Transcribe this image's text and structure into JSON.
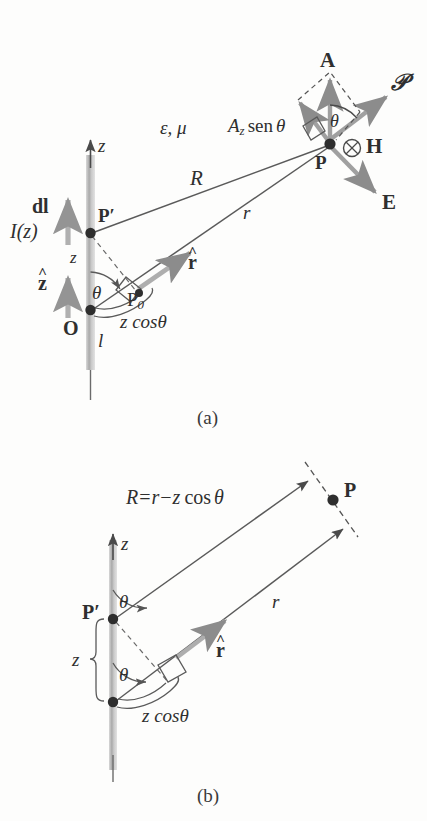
{
  "figure": {
    "background_color": "#fdfdfc",
    "ink_color": "#3a3a3a",
    "rod_color": "#b9b9b9",
    "vector_color": "#8f8f8f"
  },
  "panel_a": {
    "caption": "(a)",
    "medium_label": "ε, μ",
    "projection_label_A": "A",
    "projection_label_z": "z",
    "projection_label_sen": "sen",
    "projection_label_theta": "θ",
    "labels": {
      "z_axis": "z",
      "dl": "dl",
      "current": "I(z)",
      "z_hat": "z",
      "z_segment": "z",
      "origin": "O",
      "length": "l",
      "source_point": "P′",
      "foot_point": "P",
      "foot_point_sub": "0",
      "field_point": "P",
      "R_label": "R",
      "r_label": "r",
      "r_hat": "r",
      "theta": "θ",
      "theta_top": "θ",
      "z_cos_theta": "z cosθ",
      "vector_A": "A",
      "vector_P": "𝒫",
      "vector_H": "H",
      "vector_E": "E",
      "H_into_page": "⊗"
    }
  },
  "panel_b": {
    "caption": "(b)",
    "labels": {
      "z_axis": "z",
      "R_equation": "R = r − z cos θ",
      "R_eq_R": "R",
      "R_eq_eq": "=",
      "R_eq_r": "r",
      "R_eq_minus": "−",
      "R_eq_z": "z",
      "R_eq_cos": "cos",
      "R_eq_theta": "θ",
      "source_point": "P′",
      "field_point": "P",
      "r_label": "r",
      "r_hat": "r",
      "theta_top": "θ",
      "theta_bottom": "θ",
      "z_brace": "z",
      "z_cos_theta": "z cosθ"
    }
  }
}
